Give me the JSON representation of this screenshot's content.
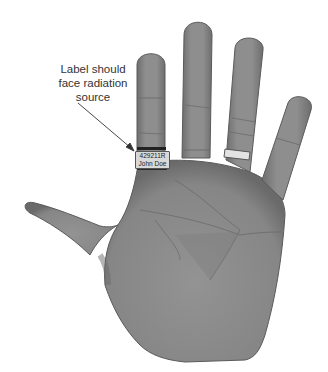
{
  "annotation": {
    "lines": [
      "Label should",
      "face radiation",
      "source"
    ]
  },
  "ring_label": {
    "id": "429211R",
    "name": "John Doe"
  },
  "figure": {
    "background_color": "#ffffff",
    "hand_color": "#8a8a8a",
    "arrow_color": "#333333"
  }
}
